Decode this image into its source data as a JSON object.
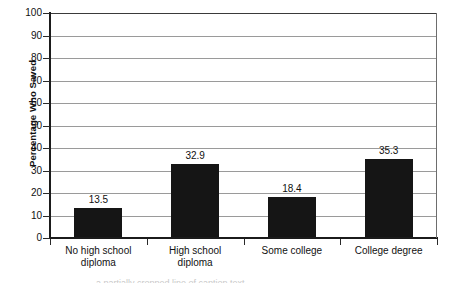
{
  "chart_data": {
    "type": "bar",
    "title": "",
    "xlabel": "",
    "ylabel": "Percentage Who Saved",
    "ylim": [
      0,
      100
    ],
    "grid": true,
    "legend": "none",
    "categories": [
      "No high school\ndiploma",
      "High school\ndiploma",
      "Some college",
      "College degree"
    ],
    "values": [
      13.5,
      32.9,
      18.4,
      35.3
    ],
    "value_labels": [
      "13.5",
      "32.9",
      "18.4",
      "35.3"
    ],
    "ytick_labels": [
      "100",
      "90",
      "80",
      "70",
      "60",
      "50",
      "40",
      "30",
      "20",
      "10",
      "0"
    ],
    "yticks": [
      100,
      90,
      80,
      70,
      60,
      50,
      40,
      30,
      20,
      10,
      0
    ],
    "bar_color": "#151515",
    "gridline_color": "#9a9a9a",
    "axis_color": "#1b1b1b"
  },
  "caption_remnant": "a partially cropped line of caption text"
}
